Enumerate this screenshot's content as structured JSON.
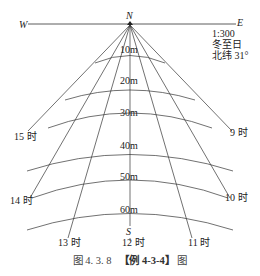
{
  "compass": {
    "west": "W",
    "east": "E",
    "north": "N",
    "south": "S"
  },
  "info": {
    "scale": "1:300",
    "date": "冬至日",
    "latitude": "北纬 31°"
  },
  "distance_labels": [
    "10m",
    "20m",
    "30m",
    "40m",
    "50m",
    "60m"
  ],
  "hour_labels": {
    "h9": "9 时",
    "h10": "10 时",
    "h11": "11 时",
    "h12": "12 时",
    "h13": "13 时",
    "h14": "14 时",
    "h15": "15 时"
  },
  "caption": {
    "figure": "图 4. 3. 8",
    "example": "【例 4-3-4】",
    "suffix": "图"
  }
}
